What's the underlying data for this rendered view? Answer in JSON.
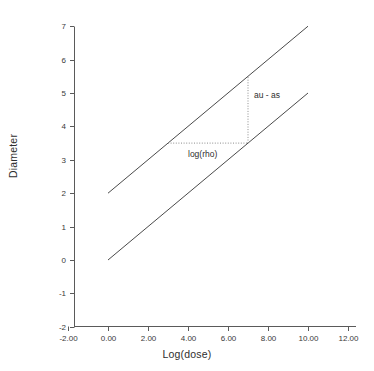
{
  "chart_data": {
    "type": "line",
    "title": "",
    "xlabel": "Log(dose)",
    "ylabel": "Diameter",
    "xlim": [
      -2,
      12
    ],
    "ylim": [
      -2,
      8
    ],
    "grid": false,
    "legend": "none",
    "xticks": [
      "-2.00",
      "0.00",
      "2.00",
      "4.00",
      "6.00",
      "8.00",
      "10.00",
      "12.00"
    ],
    "xtick_values": [
      -2,
      0,
      2,
      4,
      6,
      8,
      10,
      12
    ],
    "yticks": [
      "-2",
      "-1",
      "0",
      "1",
      "2",
      "3",
      "4",
      "5",
      "6",
      "7",
      "8"
    ],
    "ytick_values": [
      -2,
      -1,
      0,
      1,
      2,
      3,
      4,
      5,
      6,
      7,
      8
    ],
    "series": [
      {
        "name": "upper-line",
        "x": [
          0,
          10
        ],
        "values": [
          2,
          7
        ],
        "style": "solid",
        "color": "#4a4a4a"
      },
      {
        "name": "lower-line",
        "x": [
          0,
          10
        ],
        "values": [
          0,
          5
        ],
        "style": "solid",
        "color": "#4a4a4a"
      }
    ],
    "annotations": [
      {
        "name": "log-rho-guide",
        "label": "log(rho)",
        "type": "horizontal-dotted-segment",
        "y": 3.5,
        "x_start": 3,
        "x_end": 7,
        "label_x": 4.0,
        "label_y": 3.15
      },
      {
        "name": "au-as-guide",
        "label": "au - as",
        "type": "vertical-dotted-segment",
        "x": 7,
        "y_start": 3.5,
        "y_end": 5.5,
        "label_x": 7.3,
        "label_y": 4.9
      }
    ]
  },
  "colors": {
    "axis": "#5a5a5a",
    "line": "#4a4a4a",
    "dotted": "#8c8c8c",
    "text": "#2e2e2e",
    "background": "#ffffff"
  }
}
